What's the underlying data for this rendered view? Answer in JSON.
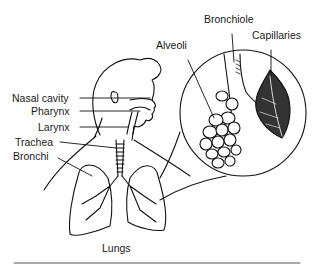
{
  "diagram": {
    "labels": {
      "nasal_cavity": "Nasal cavity",
      "pharynx": "Pharynx",
      "larynx": "Larynx",
      "trachea": "Trachea",
      "bronchi": "Bronchi",
      "lungs": "Lungs",
      "alveoli": "Alveoli",
      "bronchiole": "Bronchiole",
      "capillaries": "Capillaries"
    },
    "colors": {
      "ink": "#111111",
      "background": "#ffffff",
      "rule": "#555555"
    }
  }
}
